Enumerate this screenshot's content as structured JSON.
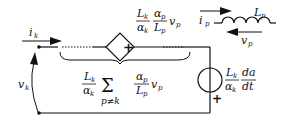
{
  "diagram": {
    "type": "circuit",
    "labels": {
      "current_k": "i",
      "current_k_sub": "k",
      "voltage_k": "v",
      "voltage_k_sub": "k",
      "source_top": {
        "L": "L",
        "L_sub": "k",
        "alpha": "α",
        "alpha_sub": "k",
        "alpha_p": "α",
        "alpha_p_sub": "p",
        "Lp": "L",
        "Lp_sub": "p",
        "v": "v",
        "v_sub": "p"
      },
      "controlled_source_symbols": {
        "left": "|",
        "right": "+"
      },
      "sum_expression": {
        "L": "L",
        "L_sub": "k",
        "alpha": "α",
        "alpha_sub": "k",
        "sigma": "Σ",
        "sigma_sub": "p≠k",
        "alpha_p": "α",
        "alpha_p_sub": "p",
        "Lp": "L",
        "Lp_sub": "p",
        "v": "v",
        "v_sub": "p"
      },
      "right_source": {
        "L": "L",
        "L_sub": "k",
        "alpha": "α",
        "alpha_sub": "k",
        "da": "da",
        "dt": "dt",
        "plus": "+"
      },
      "inductor_legend": {
        "i": "i",
        "i_sub": "p",
        "L": "L",
        "L_sub": "p",
        "v": "v",
        "v_sub": "p"
      }
    },
    "colors": {
      "stroke": "#111111",
      "background": "#ffffff"
    }
  }
}
